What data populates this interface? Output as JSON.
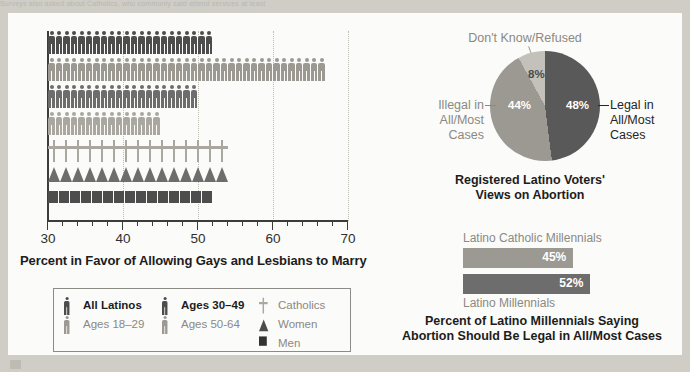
{
  "bleed_text": "Surveys also asked about Catholics, who commonly said attend services at least",
  "picto_chart": {
    "caption": "Percent in Favor of Allowing Gays and Lesbians to Marry",
    "axis": {
      "min": 30,
      "max": 70,
      "ticks": [
        30,
        40,
        50,
        60,
        70
      ],
      "minor_step": 2
    },
    "gridlines": [
      40,
      50,
      60,
      70
    ],
    "rows": [
      {
        "name": "All Latinos",
        "value": 52,
        "glyph": "person",
        "color": "#4d4d4d"
      },
      {
        "name": "Ages 18-29",
        "value": 67,
        "glyph": "person",
        "color": "#9b9992"
      },
      {
        "name": "Ages 30-49",
        "value": 50,
        "glyph": "person",
        "color": "#6d6d6d"
      },
      {
        "name": "Ages 50-64",
        "value": 45,
        "glyph": "person",
        "color": "#a9a7a0"
      },
      {
        "name": "Catholics",
        "value": 54,
        "glyph": "cross",
        "color": "#a9a7a0"
      },
      {
        "name": "Women",
        "value": 54,
        "glyph": "triangle",
        "color": "#6d6d6d"
      },
      {
        "name": "Men",
        "value": 52,
        "glyph": "square",
        "color": "#4d4d4d"
      }
    ],
    "legend": {
      "col1": [
        {
          "label": "All Latinos",
          "glyph": "person",
          "color": "#4d4d4d",
          "bold": true
        },
        {
          "label": "Ages 18–29",
          "glyph": "person",
          "color": "#9b9992",
          "bold": false
        }
      ],
      "col2": [
        {
          "label": "Ages 30–49",
          "glyph": "person",
          "color": "#4d4d4d",
          "bold": true
        },
        {
          "label": "Ages 50-64",
          "glyph": "person",
          "color": "#9b9992",
          "bold": false
        }
      ],
      "col3": [
        {
          "label": "Catholics",
          "glyph": "cross",
          "color": "#a9a7a0",
          "bold": false
        },
        {
          "label": "Women",
          "glyph": "triangle",
          "color": "#4d4d4d",
          "bold": false
        },
        {
          "label": "Men",
          "glyph": "square",
          "color": "#333333",
          "bold": false
        }
      ]
    }
  },
  "pie_chart": {
    "caption_line1": "Registered Latino Voters'",
    "caption_line2": "Views on Abortion",
    "dont_know_title": "Don't Know/Refused",
    "left_label_lines": [
      "Illegal in",
      "All/Most",
      "Cases"
    ],
    "right_label_lines": [
      "Legal in",
      "All/Most",
      "Cases"
    ],
    "slices": [
      {
        "name": "Legal in All/Most Cases",
        "value": 48,
        "label": "48%",
        "color": "#595959"
      },
      {
        "name": "Illegal in All/Most Cases",
        "value": 44,
        "label": "44%",
        "color": "#9b9992"
      },
      {
        "name": "Don't Know/Refused",
        "value": 8,
        "label": "8%",
        "color": "#c3c1ba"
      }
    ]
  },
  "mini_bars": {
    "caption_line1": "Percent of Latino Millennials Saying",
    "caption_line2": "Abortion Should Be Legal in All/Most Cases",
    "bars": [
      {
        "label": "Latino Catholic Millennials",
        "value": 45,
        "value_text": "45%",
        "color": "#9b9992",
        "label_pos": "above"
      },
      {
        "label": "Latino Millennials",
        "value": 52,
        "value_text": "52%",
        "color": "#6d6d6d",
        "label_pos": "below"
      }
    ]
  }
}
